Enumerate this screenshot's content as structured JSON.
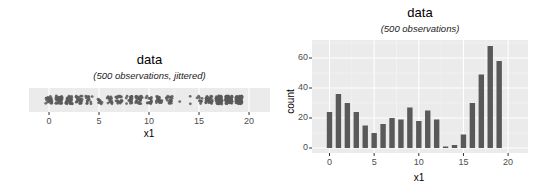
{
  "chart_data": [
    {
      "type": "strip",
      "title": "data",
      "subtitle": "(500 observations, jittered)",
      "xlabel": "x1",
      "ylabel": "",
      "xlim": [
        -1,
        23
      ],
      "xticks": [
        0,
        5,
        10,
        15,
        20
      ],
      "grid": true,
      "x": [
        0,
        1,
        2,
        3,
        4,
        5,
        6,
        7,
        8,
        9,
        10,
        11,
        12,
        13,
        14,
        15,
        16,
        17,
        18,
        19
      ],
      "counts": [
        24,
        36,
        30,
        24,
        15,
        10,
        16,
        20,
        19,
        27,
        18,
        25,
        19,
        1,
        2,
        9,
        30,
        49,
        68,
        58
      ]
    },
    {
      "type": "bar",
      "title": "data",
      "subtitle": "(500 observations)",
      "xlabel": "x1",
      "ylabel": "count",
      "categories": [
        0,
        1,
        2,
        3,
        4,
        5,
        6,
        7,
        8,
        9,
        10,
        11,
        12,
        13,
        14,
        15,
        16,
        17,
        18,
        19
      ],
      "values": [
        24,
        36,
        30,
        24,
        15,
        10,
        16,
        20,
        19,
        27,
        18,
        25,
        19,
        1,
        2,
        9,
        30,
        49,
        68,
        58
      ],
      "xticks": [
        0,
        5,
        10,
        15,
        20
      ],
      "yticks": [
        0,
        20,
        40,
        60
      ],
      "ylim": [
        0,
        72
      ],
      "grid": true
    }
  ],
  "colors": {
    "panel": "#ebebeb",
    "grid": "#ffffff",
    "geom": "#595959",
    "tick": "#333333"
  }
}
